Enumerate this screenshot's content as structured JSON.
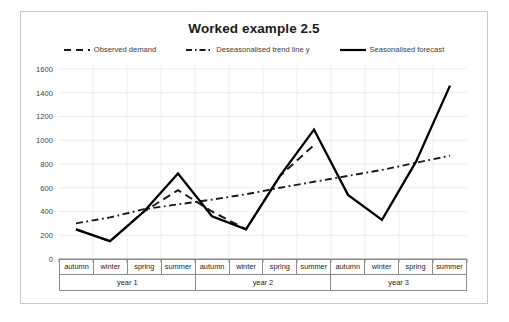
{
  "chart": {
    "title": "Worked example 2.5"
  },
  "legend": {
    "position": "top-center",
    "items": [
      {
        "label": "Observed demand",
        "style": "dashed",
        "color": "#1a1a1a"
      },
      {
        "label": "Deseasonalised trend line y",
        "style": "dash-dot",
        "color": "#1a1a1a"
      },
      {
        "label": "Seasonalised forecast",
        "style": "solid",
        "color": "#000000"
      }
    ]
  },
  "yaxis": {
    "ticks": [
      "0",
      "200",
      "400",
      "600",
      "800",
      "1000",
      "1200",
      "1400",
      "1600"
    ],
    "min": 0,
    "max": 1600,
    "step": 200
  },
  "xaxis": {
    "quarters": [
      "autumn",
      "winter",
      "spring",
      "summer",
      "autumn",
      "winter",
      "spring",
      "summer",
      "autumn",
      "winter",
      "spring",
      "summer"
    ],
    "years": [
      "year 1",
      "year 2",
      "year 3"
    ]
  },
  "chart_data": {
    "type": "line",
    "title": "Worked example 2.5",
    "xlabel": "",
    "ylabel": "",
    "ylim": [
      0,
      1600
    ],
    "ytick_step": 200,
    "grid": true,
    "legend_position": "top-center",
    "categories": [
      "year 1 autumn",
      "year 1 winter",
      "year 1 spring",
      "year 1 summer",
      "year 2 autumn",
      "year 2 winter",
      "year 2 spring",
      "year 2 summer",
      "year 3 autumn",
      "year 3 winter",
      "year 3 spring",
      "year 3 summer"
    ],
    "series": [
      {
        "name": "Observed demand",
        "style": "dashed",
        "color": "#1a1a1a",
        "values": [
          250,
          150,
          400,
          580,
          400,
          250,
          700,
          960,
          null,
          null,
          null,
          null
        ]
      },
      {
        "name": "Deseasonalised trend line y",
        "style": "dash-dot",
        "color": "#1a1a1a",
        "values": [
          300,
          350,
          420,
          460,
          500,
          545,
          600,
          650,
          700,
          750,
          810,
          870
        ]
      },
      {
        "name": "Seasonalised forecast",
        "style": "solid",
        "color": "#000000",
        "values": [
          250,
          150,
          400,
          720,
          360,
          250,
          700,
          1090,
          540,
          330,
          820,
          1460
        ]
      }
    ]
  }
}
